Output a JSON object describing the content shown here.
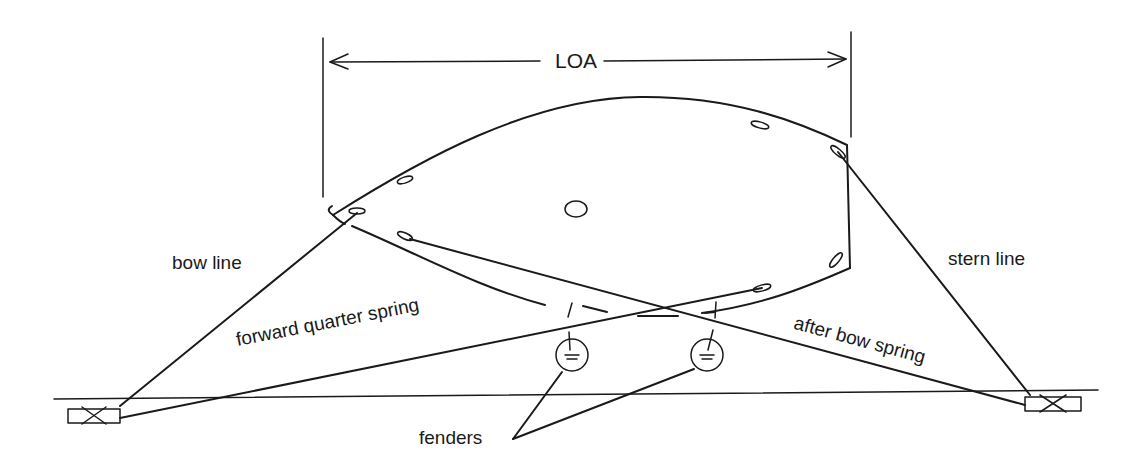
{
  "diagram": {
    "title_dimension": "LOA",
    "labels": {
      "bow_line": "bow line",
      "stern_line": "stern line",
      "forward_quarter_spring": "forward quarter spring",
      "after_bow_spring": "after bow spring",
      "fenders": "fenders"
    },
    "colors": {
      "ink": "#1a1a1a",
      "background": "#ffffff"
    }
  }
}
